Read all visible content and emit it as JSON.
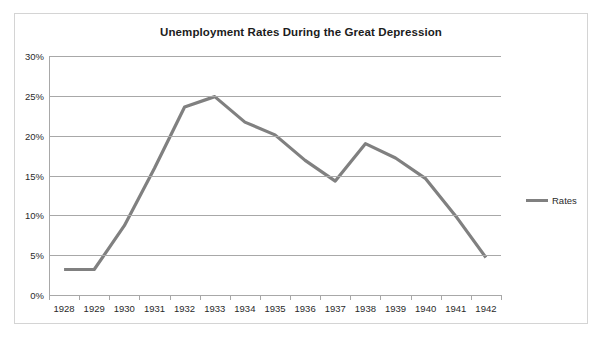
{
  "chart": {
    "title": "Unemployment Rates During the Great Depression",
    "legend_label": "Rates",
    "line_color": "#808080",
    "grid_color": "#a8a8a8",
    "border_color": "#d4d4d4"
  },
  "chart_data": {
    "type": "line",
    "title": "Unemployment Rates During the Great Depression",
    "xlabel": "",
    "ylabel": "",
    "categories": [
      "1928",
      "1929",
      "1930",
      "1931",
      "1932",
      "1933",
      "1934",
      "1935",
      "1936",
      "1937",
      "1938",
      "1939",
      "1940",
      "1941",
      "1942"
    ],
    "series": [
      {
        "name": "Rates",
        "values": [
          3.2,
          3.2,
          8.7,
          15.9,
          23.6,
          24.9,
          21.7,
          20.1,
          16.9,
          14.3,
          19.0,
          17.2,
          14.6,
          9.9,
          4.7
        ]
      }
    ],
    "ylim": [
      0,
      30
    ],
    "ytick_labels": [
      "30%",
      "25%",
      "20%",
      "15%",
      "10%",
      "5%",
      "0%"
    ],
    "ytick_values": [
      30,
      25,
      20,
      15,
      10,
      5,
      0
    ],
    "grid": "horizontal",
    "legend_position": "right"
  }
}
